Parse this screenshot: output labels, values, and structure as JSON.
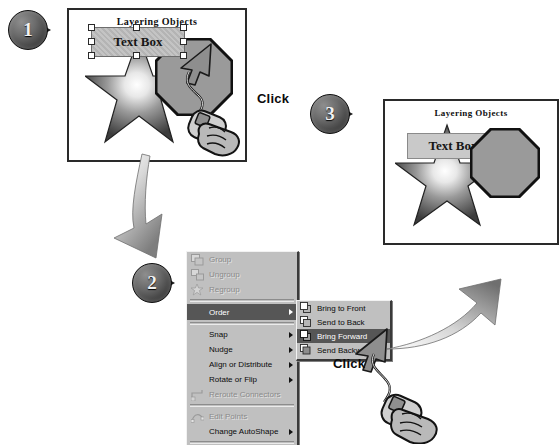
{
  "figure": {
    "kind": "instructional-diagram",
    "topic": "Layering Objects"
  },
  "steps": [
    {
      "number": "1",
      "label": "step-1"
    },
    {
      "number": "2",
      "label": "step-2"
    },
    {
      "number": "3",
      "label": "step-3"
    }
  ],
  "panel1": {
    "title": "Layering Objects",
    "textbox_text": "Text Box",
    "selected": true,
    "shapes": [
      "star",
      "octagon",
      "text-box"
    ],
    "click_label": "Click"
  },
  "panel3": {
    "title": "Layering Objects",
    "textbox_text": "Text Box",
    "selected": false,
    "shapes": [
      "star",
      "octagon",
      "text-box"
    ]
  },
  "context_menu": {
    "items": [
      {
        "label": "Group",
        "icon": "group-icon",
        "enabled": false,
        "submenu": false
      },
      {
        "label": "Ungroup",
        "icon": "ungroup-icon",
        "enabled": false,
        "submenu": false
      },
      {
        "label": "Regroup",
        "icon": "regroup-icon",
        "enabled": false,
        "submenu": false
      },
      {
        "separator": true
      },
      {
        "label": "Order",
        "icon": "",
        "enabled": true,
        "submenu": true,
        "highlighted": true,
        "accel": "O"
      },
      {
        "separator": true
      },
      {
        "label": "Snap",
        "icon": "",
        "enabled": true,
        "submenu": true,
        "accel": "n"
      },
      {
        "label": "Nudge",
        "icon": "",
        "enabled": true,
        "submenu": true,
        "accel": "N"
      },
      {
        "label": "Align or Distribute",
        "icon": "",
        "enabled": true,
        "submenu": true,
        "accel": "A"
      },
      {
        "label": "Rotate or Flip",
        "icon": "",
        "enabled": true,
        "submenu": true,
        "accel": "p"
      },
      {
        "label": "Reroute Connectors",
        "icon": "reroute-icon",
        "enabled": false,
        "submenu": false
      },
      {
        "separator": true
      },
      {
        "label": "Edit Points",
        "icon": "editpoints-icon",
        "enabled": false,
        "submenu": false
      },
      {
        "label": "Change AutoShape",
        "icon": "",
        "enabled": true,
        "submenu": true,
        "accel": "C"
      },
      {
        "separator": true
      },
      {
        "label": "Set AutoShape Defaults",
        "icon": "",
        "enabled": true,
        "submenu": false,
        "accel": "S"
      }
    ],
    "submenu": {
      "parent": "Order",
      "items": [
        {
          "label": "Bring to Front",
          "icon": "bring-to-front-icon",
          "highlighted": false,
          "accel": "t"
        },
        {
          "label": "Send to Back",
          "icon": "send-to-back-icon",
          "highlighted": false,
          "accel": "k"
        },
        {
          "label": "Bring Forward",
          "icon": "bring-forward-icon",
          "highlighted": true,
          "accel": "F"
        },
        {
          "label": "Send Backward",
          "icon": "send-backward-icon",
          "highlighted": false,
          "accel": "B"
        }
      ]
    },
    "click_label": "Click"
  },
  "colors": {
    "panel_border": "#2a2a2a",
    "menu_face": "#c0c0c0",
    "menu_highlight": "#565656",
    "shape_fill": "#9a9a9a",
    "textbox_fill": "#c9c9c9",
    "badge_dark": "#151515"
  }
}
